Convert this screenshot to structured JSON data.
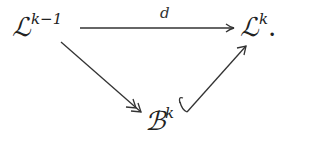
{
  "diagram": {
    "type": "commutative-diagram",
    "nodes": {
      "source": {
        "base": "ℒ",
        "sup": "k−1"
      },
      "target": {
        "base": "ℒ",
        "sup": "k",
        "trailing": "."
      },
      "bottom": {
        "base": "ℬ",
        "sup": "k"
      }
    },
    "edges": [
      {
        "from": "source",
        "to": "target",
        "label": "d",
        "style": "arrow"
      },
      {
        "from": "source",
        "to": "bottom",
        "label": "",
        "style": "two-headed-arrow (surjection)"
      },
      {
        "from": "bottom",
        "to": "target",
        "label": "",
        "style": "hooked-arrow (inclusion)"
      }
    ],
    "edge_labels": {
      "d": "d"
    },
    "stroke_color": "#333333"
  }
}
